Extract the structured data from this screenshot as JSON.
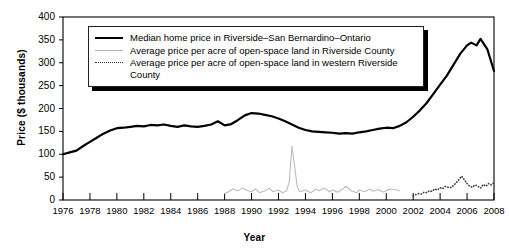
{
  "chart_data": {
    "type": "line",
    "title": "",
    "xlabel": "Year",
    "ylabel": "Price ($ thousands)",
    "xlim": [
      1976,
      2008
    ],
    "ylim": [
      0,
      400
    ],
    "yticks": [
      0,
      50,
      100,
      150,
      200,
      250,
      300,
      350,
      400
    ],
    "xticks": [
      1976,
      1978,
      1980,
      1982,
      1984,
      1986,
      1988,
      1990,
      1992,
      1994,
      1996,
      1998,
      2000,
      2002,
      2004,
      2006,
      2008
    ],
    "grid": false,
    "legend_position": "top-left-inside",
    "series": [
      {
        "name": "Median home price in Riverside–San Bernardino–Ontario",
        "style": "solid",
        "color": "#000000",
        "width": 2.2,
        "x": [
          1976.0,
          1976.5,
          1977.0,
          1977.5,
          1978.0,
          1978.5,
          1979.0,
          1979.5,
          1980.0,
          1980.5,
          1981.0,
          1981.5,
          1982.0,
          1982.5,
          1983.0,
          1983.5,
          1984.0,
          1984.5,
          1985.0,
          1985.5,
          1986.0,
          1986.5,
          1987.0,
          1987.5,
          1988.0,
          1988.5,
          1989.0,
          1989.5,
          1990.0,
          1990.5,
          1991.0,
          1991.5,
          1992.0,
          1992.5,
          1993.0,
          1993.5,
          1994.0,
          1994.5,
          1995.0,
          1995.5,
          1996.0,
          1996.5,
          1997.0,
          1997.5,
          1998.0,
          1998.5,
          1999.0,
          1999.5,
          2000.0,
          2000.5,
          2001.0,
          2001.5,
          2002.0,
          2002.5,
          2003.0,
          2003.5,
          2004.0,
          2004.5,
          2005.0,
          2005.5,
          2006.0,
          2006.3,
          2006.7,
          2007.0,
          2007.5,
          2008.0
        ],
        "y": [
          100,
          104,
          108,
          118,
          127,
          136,
          145,
          152,
          157,
          158,
          160,
          162,
          161,
          164,
          163,
          165,
          162,
          160,
          163,
          161,
          160,
          162,
          165,
          172,
          163,
          166,
          175,
          185,
          190,
          189,
          186,
          183,
          178,
          172,
          165,
          158,
          153,
          150,
          149,
          148,
          147,
          145,
          146,
          145,
          148,
          150,
          153,
          156,
          158,
          157,
          162,
          170,
          182,
          196,
          212,
          232,
          252,
          272,
          296,
          320,
          338,
          344,
          338,
          352,
          330,
          282
        ]
      },
      {
        "name": "Average price per acre of open-space land in Riverside County",
        "style": "solid",
        "color": "#bcbcbc",
        "width": 1.1,
        "x": [
          1988.0,
          1988.3,
          1988.6,
          1989.0,
          1989.3,
          1989.6,
          1990.0,
          1990.3,
          1990.6,
          1991.0,
          1991.3,
          1991.6,
          1992.0,
          1992.3,
          1992.6,
          1992.8,
          1993.0,
          1993.2,
          1993.4,
          1993.6,
          1994.0,
          1994.4,
          1994.8,
          1995.0,
          1995.4,
          1995.8,
          1996.0,
          1996.4,
          1996.8,
          1997.0,
          1997.4,
          1997.8,
          1998.0,
          1998.4,
          1998.8,
          1999.0,
          1999.4,
          1999.8,
          2000.0,
          2000.4,
          2000.8,
          2001.0
        ],
        "y": [
          14,
          18,
          24,
          20,
          26,
          22,
          18,
          24,
          16,
          20,
          26,
          18,
          22,
          16,
          20,
          40,
          118,
          72,
          28,
          18,
          22,
          16,
          24,
          20,
          26,
          18,
          22,
          17,
          25,
          30,
          20,
          16,
          22,
          18,
          24,
          19,
          23,
          17,
          21,
          24,
          22,
          20
        ]
      },
      {
        "name": "Average price per acre of open-space land in western Riverside County",
        "style": "dotted",
        "color": "#3a3a3a",
        "width": 1.6,
        "x": [
          2002.0,
          2002.2,
          2002.4,
          2002.6,
          2002.8,
          2003.0,
          2003.2,
          2003.4,
          2003.6,
          2003.8,
          2004.0,
          2004.2,
          2004.4,
          2004.6,
          2004.8,
          2005.0,
          2005.2,
          2005.4,
          2005.6,
          2005.8,
          2006.0,
          2006.2,
          2006.4,
          2006.6,
          2006.8,
          2007.0,
          2007.2,
          2007.4,
          2007.6,
          2007.8,
          2008.0
        ],
        "y": [
          9,
          12,
          14,
          13,
          17,
          16,
          20,
          19,
          24,
          22,
          27,
          25,
          30,
          28,
          27,
          32,
          38,
          45,
          52,
          44,
          36,
          30,
          28,
          33,
          30,
          26,
          34,
          30,
          36,
          33,
          38
        ]
      }
    ]
  },
  "legend": {
    "items": [
      {
        "label": "Median home price in Riverside–San Bernardino–Ontario",
        "style": "solid"
      },
      {
        "label": "Average price per acre of open-space land in Riverside County",
        "style": "gray"
      },
      {
        "label": "Average price per acre of open-space land in western Riverside County",
        "style": "dotted"
      }
    ]
  },
  "axes": {
    "ylabel": "Price ($ thousands)",
    "xlabel": "Year"
  }
}
